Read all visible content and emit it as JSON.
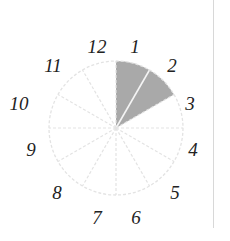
{
  "diagram": {
    "type": "clock-face-fraction",
    "center": [
      116,
      128
    ],
    "radius": 67,
    "sectors_total": 12,
    "shaded_sectors": [
      0,
      1
    ],
    "colors": {
      "shaded": "#a9a9a9",
      "outline": "#e3e3e3",
      "label": "#222222",
      "divider": "#d8d8d8"
    },
    "labels": [
      {
        "text": "12",
        "x": 97,
        "y": 53
      },
      {
        "text": "1",
        "x": 135,
        "y": 53
      },
      {
        "text": "2",
        "x": 172,
        "y": 72
      },
      {
        "text": "3",
        "x": 190,
        "y": 110
      },
      {
        "text": "4",
        "x": 193,
        "y": 156
      },
      {
        "text": "5",
        "x": 175,
        "y": 199
      },
      {
        "text": "6",
        "x": 136,
        "y": 224
      },
      {
        "text": "7",
        "x": 97,
        "y": 224
      },
      {
        "text": "8",
        "x": 57,
        "y": 199
      },
      {
        "text": "9",
        "x": 31,
        "y": 156
      },
      {
        "text": "10",
        "x": 19,
        "y": 110
      },
      {
        "text": "11",
        "x": 53,
        "y": 72
      }
    ]
  }
}
